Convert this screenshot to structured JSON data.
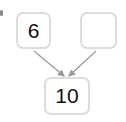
{
  "diagram": {
    "type": "number-bond",
    "top_left": {
      "value": "6"
    },
    "top_right": {
      "value": ""
    },
    "bottom": {
      "value": "10"
    },
    "colors": {
      "border": "#dcdcdc",
      "arrow": "#999999",
      "text": "#111111"
    }
  }
}
